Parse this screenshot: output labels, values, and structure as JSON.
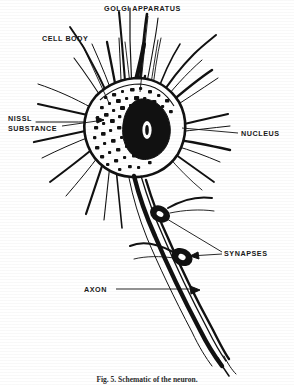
{
  "figure": {
    "title_caption": "Fig. 5. Schematic of the neuron.",
    "style": "black-and-white-line-drawing",
    "ink_color": "#111111",
    "background_color": "#ffffff"
  },
  "labels": [
    {
      "id": "golgi-apparatus",
      "text": "GOLGI APPARATUS",
      "x": 104,
      "y": 4
    },
    {
      "id": "cell-body",
      "text": "CELL BODY",
      "x": 42,
      "y": 34
    },
    {
      "id": "nissl-substance",
      "text": "NISSL",
      "x": 8,
      "y": 114
    },
    {
      "id": "nissl-substance-2",
      "text": "SUBSTANCE",
      "x": 8,
      "y": 125
    },
    {
      "id": "nucleus",
      "text": "NUCLEUS",
      "x": 241,
      "y": 129
    },
    {
      "id": "synapses",
      "text": "SYNAPSES",
      "x": 224,
      "y": 249
    },
    {
      "id": "axon",
      "text": "AXON",
      "x": 84,
      "y": 285
    }
  ],
  "anatomy_parts": [
    "cell body (soma)",
    "nucleus",
    "nissl substance",
    "golgi apparatus",
    "dendrites",
    "axon",
    "synapses"
  ],
  "leader_lines": [
    {
      "from": "cell-body",
      "to": "soma-upper-left"
    },
    {
      "from": "golgi-apparatus",
      "to": "soma-golgi-region"
    },
    {
      "from": "nissl-substance",
      "to": "soma-left-speckles"
    },
    {
      "from": "nucleus",
      "to": "soma-nucleus"
    },
    {
      "from": "synapses",
      "to": "axon-bouton-upper"
    },
    {
      "from": "synapses",
      "to": "axon-bouton-lower"
    },
    {
      "from": "axon",
      "to": "axon-shaft"
    }
  ]
}
